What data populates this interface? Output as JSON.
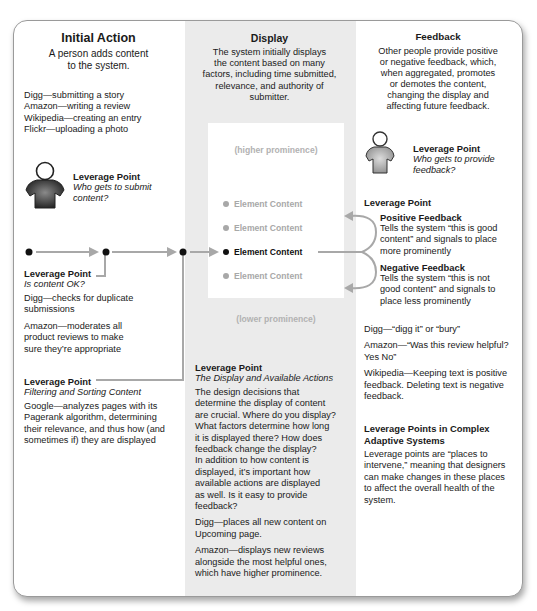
{
  "initial_action": {
    "title": "Initial Action",
    "description_lines": [
      "A person adds content",
      "to the system."
    ],
    "examples": [
      "Digg—submitting a story",
      "Amazon—writing a review",
      "Wikipedia—creating an entry",
      "Flickr—uploading a photo"
    ],
    "leverage_submit": {
      "label": "Leverage Point",
      "question_lines": [
        "Who gets to submit",
        "content?"
      ]
    },
    "leverage_ok": {
      "label": "Leverage Point",
      "question": "Is content OK?",
      "paragraphs": [
        [
          "Digg—checks for duplicate",
          "submissions"
        ],
        [
          "Amazon—moderates all",
          "product reviews to make",
          "sure they’re appropriate"
        ]
      ]
    },
    "leverage_filter": {
      "label": "Leverage Point",
      "question": "Filtering and Sorting Content",
      "paragraph_lines": [
        "Google—analyzes pages with its",
        "Pagerank algorithm, determining",
        "their relevance, and thus how (and",
        "sometimes if) they are displayed"
      ]
    }
  },
  "display": {
    "title": "Display",
    "description_lines": [
      "The system initially displays",
      "the content based on many",
      "factors, including time submitted,",
      "relevance, and authority of",
      "submitter."
    ],
    "higher_label": "(higher prominence)",
    "lower_label": "(lower prominence)",
    "elements": [
      {
        "label": "Element Content",
        "active": false
      },
      {
        "label": "Element Content",
        "active": false
      },
      {
        "label": "Element Content",
        "active": true
      },
      {
        "label": "Element Content",
        "active": false
      }
    ],
    "leverage": {
      "label": "Leverage Point",
      "question": "The Display and Available Actions",
      "paragraphs": [
        [
          "The design decisions that",
          "determine the display of content",
          "are crucial. Where do you display?",
          "What factors determine how long",
          "it is displayed there? How does",
          "feedback change the display?",
          "In addition to how content is",
          "displayed, it’s important how",
          "available actions are displayed",
          "as well. Is it easy to provide",
          "feedback?"
        ],
        [
          "Digg—places all new content on",
          "Upcoming page."
        ],
        [
          "Amazon—displays new reviews",
          "alongside the most helpful ones,",
          "which have higher prominence."
        ]
      ]
    }
  },
  "feedback": {
    "title": "Feedback",
    "description_lines": [
      "Other people provide positive",
      "or negative feedback, which,",
      "when aggregated, promotes",
      "or demotes the content,",
      "changing the display and",
      "affecting future feedback."
    ],
    "leverage_provide": {
      "label": "Leverage Point",
      "question_lines": [
        "Who gets to provide",
        "feedback?"
      ]
    },
    "leverage_loop": {
      "label": "Leverage Point",
      "positive": {
        "title": "Positive Feedback",
        "lines": [
          "Tells the system “this is good",
          "content” and signals to place",
          "more prominently"
        ]
      },
      "negative": {
        "title": "Negative Feedback",
        "lines": [
          "Tells the system “this is not",
          "good content” and signals to",
          "place less prominently"
        ]
      }
    },
    "examples": [
      [
        "Digg—“digg it” or “bury”"
      ],
      [
        "Amazon—“Was this review helpful?",
        "Yes No”"
      ],
      [
        "Wikipedia—Keeping text is positive",
        "feedback. Deleting text is negative",
        "feedback."
      ]
    ],
    "complex": {
      "title_lines": [
        "Leverage Points in Complex",
        "Adaptive Systems"
      ],
      "lines": [
        "Leverage points are “places to",
        "intervene,” meaning that designers",
        "can make changes in these places",
        "to affect the overall health of the",
        "system."
      ]
    }
  },
  "colors": {
    "panel_gray": "#ebebeb",
    "line_gray": "#a8a8a8",
    "text_dark": "#1a1a1a",
    "muted": "#a8a8a8"
  }
}
